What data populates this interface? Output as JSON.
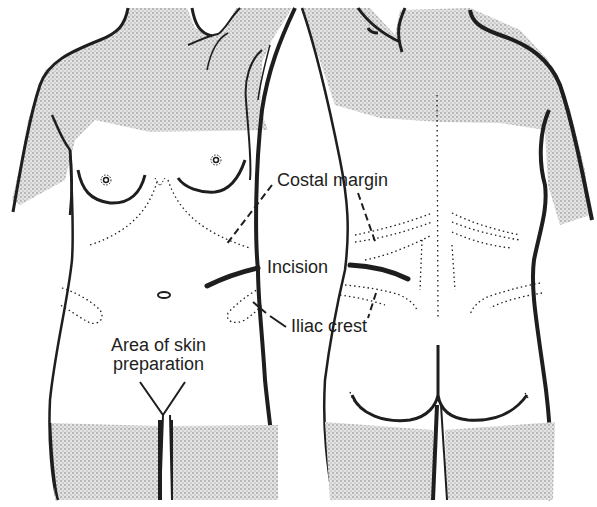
{
  "figure": {
    "views": [
      "anterior",
      "posterior"
    ],
    "colors": {
      "line": "#1e1e1e",
      "stipple": "#6b6b6b",
      "background": "#ffffff"
    }
  },
  "labels": {
    "costal_margin": "Costal margin",
    "incision": "Incision",
    "iliac_crest": "Iliac crest",
    "area_line1": "Area of skin",
    "area_line2": "preparation"
  }
}
